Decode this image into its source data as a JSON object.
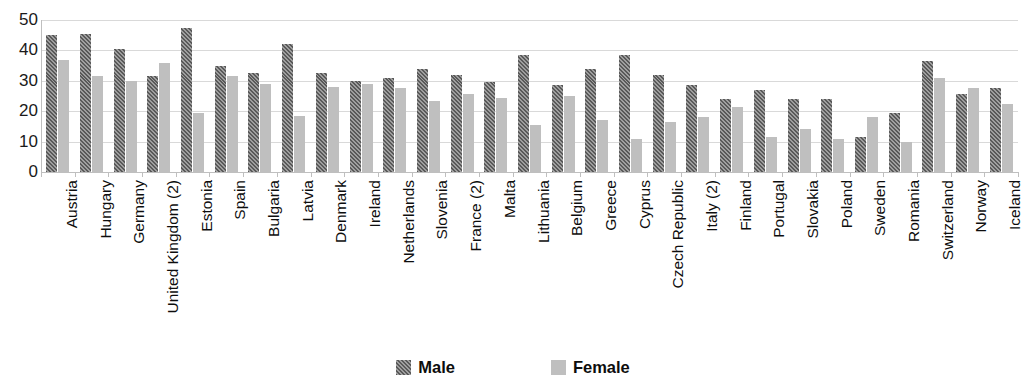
{
  "chart_data": {
    "type": "bar",
    "title": "",
    "xlabel": "",
    "ylabel": "",
    "ylim": [
      0,
      50
    ],
    "yticks": [
      0,
      10,
      20,
      30,
      40,
      50
    ],
    "grid": true,
    "legend_position": "bottom-center",
    "categories": [
      "Austria",
      "Hungary",
      "Germany",
      "United Kingdom (2)",
      "Estonia",
      "Spain",
      "Bulgaria",
      "Latvia",
      "Denmark",
      "Ireland",
      "Netherlands",
      "Slovenia",
      "France (2)",
      "Malta",
      "Lithuania",
      "Belgium",
      "Greece",
      "Cyprus",
      "Czech Republic",
      "Italy (2)",
      "Finland",
      "Portugal",
      "Slovakia",
      "Poland",
      "Sweden",
      "Romania",
      "Switzerland",
      "Norway",
      "Iceland"
    ],
    "series": [
      {
        "name": "Male",
        "color": "#595959",
        "pattern": "diagonal-hatch",
        "values": [
          45.0,
          45.5,
          40.5,
          31.5,
          47.5,
          35.0,
          32.5,
          42.0,
          32.5,
          30.0,
          31.0,
          34.0,
          32.0,
          29.5,
          38.5,
          28.5,
          34.0,
          38.5,
          32.0,
          28.5,
          24.0,
          27.0,
          24.0,
          24.0,
          11.5,
          19.5,
          36.5,
          25.5,
          27.5
        ]
      },
      {
        "name": "Female",
        "color": "#bfbfbf",
        "pattern": "solid",
        "values": [
          37.0,
          31.5,
          30.0,
          36.0,
          19.5,
          31.5,
          29.0,
          18.5,
          28.0,
          29.0,
          27.5,
          23.5,
          25.5,
          24.5,
          15.5,
          25.0,
          17.0,
          11.0,
          16.5,
          18.0,
          21.5,
          11.5,
          14.0,
          11.0,
          18.0,
          10.0,
          31.0,
          27.5,
          22.5
        ]
      }
    ]
  },
  "legend": {
    "items": [
      {
        "label": "Male"
      },
      {
        "label": "Female"
      }
    ]
  },
  "axis": {
    "y_tick_labels": [
      "50",
      "40",
      "30",
      "20",
      "10",
      "0"
    ]
  },
  "title_strip": {
    "text": ""
  }
}
